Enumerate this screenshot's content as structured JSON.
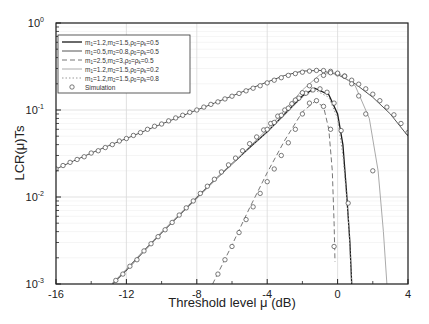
{
  "chart_data": {
    "type": "line",
    "title": "",
    "xlabel": "Threshold level μ (dB)",
    "ylabel": "LCR(μ)Ts",
    "xlim": [
      -16,
      4
    ],
    "ylim": [
      0.001,
      1
    ],
    "yscale": "log",
    "grid": true,
    "legend_position": "upper left",
    "x_ticks": [
      -16,
      -12,
      -8,
      -4,
      0,
      4
    ],
    "x_tick_labels": [
      "-16",
      "-12",
      "-8",
      "-4",
      "0",
      "4"
    ],
    "y_ticks": [
      0.001,
      0.01,
      0.1,
      1
    ],
    "y_tick_labels": [
      [
        "10",
        "-3"
      ],
      [
        "10",
        "-2"
      ],
      [
        "10",
        "-1"
      ],
      [
        "10",
        "0"
      ]
    ],
    "series": [
      {
        "name": "m1=1.2,m2=1.5,ρ0=ρk=0.5",
        "legend": [
          "m",
          "1",
          "=1.2,m",
          "2",
          "=1.5,ρ",
          "0",
          "=ρ",
          "k",
          "=0.5"
        ],
        "style": "solid",
        "color": "#1a1a1a",
        "width": 1.3,
        "x": [
          -12.8,
          -12,
          -11,
          -10,
          -9,
          -8,
          -7,
          -6,
          -5,
          -4,
          -3,
          -2,
          -1.3,
          -0.5,
          0,
          0.3,
          0.5,
          0.7,
          0.8
        ],
        "y": [
          0.001,
          0.00145,
          0.0024,
          0.0039,
          0.0062,
          0.0098,
          0.0155,
          0.024,
          0.037,
          0.056,
          0.09,
          0.145,
          0.178,
          0.15,
          0.09,
          0.04,
          0.012,
          0.003,
          0.001
        ],
        "sim_x": [
          -12.6,
          -12.2,
          -11.8,
          -11.4,
          -11,
          -10.6,
          -10.2,
          -9.8,
          -9.4,
          -9,
          -8.6,
          -8.2,
          -7.8,
          -7.4,
          -7,
          -6.6,
          -6.2,
          -5.8,
          -5.4,
          -5,
          -4.6,
          -4.2,
          -3.8,
          -3.4,
          -3,
          -2.6,
          -2.2,
          -1.8,
          -1.4,
          -1,
          -0.6,
          -0.2,
          0.2,
          0.6
        ],
        "sim_y": [
          0.0011,
          0.0013,
          0.0016,
          0.0019,
          0.0024,
          0.0029,
          0.0035,
          0.0042,
          0.0051,
          0.0062,
          0.0075,
          0.009,
          0.011,
          0.0133,
          0.016,
          0.0194,
          0.0234,
          0.028,
          0.034,
          0.041,
          0.049,
          0.059,
          0.07,
          0.085,
          0.1,
          0.118,
          0.137,
          0.156,
          0.17,
          0.175,
          0.16,
          0.12,
          0.058,
          0.0085
        ]
      },
      {
        "name": "m1=0.5,m2=0.8,ρ0=ρk=0.5",
        "legend": [
          "m",
          "1",
          "=0.5,m",
          "2",
          "=0.8,ρ",
          "0",
          "=ρ",
          "k",
          "=0.5"
        ],
        "style": "solid",
        "color": "#555555",
        "width": 1.0,
        "x": [
          -16,
          -15,
          -14,
          -13,
          -12,
          -11,
          -10,
          -9,
          -8,
          -7,
          -6,
          -5,
          -4,
          -3,
          -2,
          -1,
          0,
          1,
          2,
          3,
          4
        ],
        "y": [
          0.021,
          0.026,
          0.032,
          0.039,
          0.047,
          0.057,
          0.069,
          0.083,
          0.1,
          0.12,
          0.145,
          0.175,
          0.21,
          0.25,
          0.28,
          0.285,
          0.255,
          0.2,
          0.14,
          0.09,
          0.05
        ],
        "sim_x": [
          -16,
          -15.6,
          -15.2,
          -14.8,
          -14.4,
          -14,
          -13.6,
          -13.2,
          -12.8,
          -12.4,
          -12,
          -11.6,
          -11.2,
          -10.8,
          -10.4,
          -10,
          -9.6,
          -9.2,
          -8.8,
          -8.4,
          -8,
          -7.6,
          -7.2,
          -6.8,
          -6.4,
          -6,
          -5.6,
          -5.2,
          -4.8,
          -4.4,
          -4,
          -3.6,
          -3.2,
          -2.8,
          -2.4,
          -2,
          -1.6,
          -1.2,
          -0.8,
          -0.4,
          0,
          0.4,
          0.8,
          1.2,
          1.6,
          2,
          2.4,
          2.8,
          3.2,
          3.6,
          4
        ],
        "sim_y": [
          0.021,
          0.023,
          0.025,
          0.027,
          0.029,
          0.032,
          0.034,
          0.037,
          0.04,
          0.044,
          0.047,
          0.051,
          0.055,
          0.06,
          0.065,
          0.069,
          0.075,
          0.081,
          0.087,
          0.094,
          0.1,
          0.108,
          0.116,
          0.124,
          0.134,
          0.144,
          0.155,
          0.166,
          0.178,
          0.19,
          0.205,
          0.22,
          0.235,
          0.25,
          0.262,
          0.272,
          0.28,
          0.285,
          0.284,
          0.278,
          0.26,
          0.245,
          0.22,
          0.198,
          0.175,
          0.152,
          0.128,
          0.108,
          0.088,
          0.07,
          0.055
        ]
      },
      {
        "name": "m1=2.5,m2=3,ρ0=ρk=0.5",
        "legend": [
          "m",
          "1",
          "=2.5,m",
          "2",
          "=3,ρ",
          "0",
          "=ρ",
          "k",
          "=0.5"
        ],
        "style": "dashed",
        "color": "#777777",
        "width": 1.0,
        "x": [
          -7.1,
          -6,
          -5,
          -4,
          -3,
          -2,
          -1.3,
          -0.8,
          -0.5,
          -0.3,
          -0.2,
          -0.15
        ],
        "y": [
          0.001,
          0.0028,
          0.0075,
          0.019,
          0.045,
          0.095,
          0.125,
          0.11,
          0.06,
          0.02,
          0.005,
          0.0018
        ],
        "sim_x": [
          -6.8,
          -6.4,
          -6,
          -5.6,
          -5.2,
          -4.8,
          -4.4,
          -4,
          -3.6,
          -3.2,
          -2.8,
          -2.4,
          -2,
          -1.6,
          -1.2,
          -0.8,
          -0.4,
          -0.2
        ],
        "sim_y": [
          0.0013,
          0.0019,
          0.0027,
          0.0039,
          0.0055,
          0.0077,
          0.011,
          0.015,
          0.021,
          0.03,
          0.042,
          0.06,
          0.09,
          0.12,
          0.128,
          0.11,
          0.06,
          0.0027
        ]
      },
      {
        "name": "m1=1.2,m2=1.5,ρ0=ρk=0.2",
        "legend": [
          "m",
          "1",
          "=1.2,m",
          "2",
          "=1.5,ρ",
          "0",
          "=ρ",
          "k",
          "=0.2"
        ],
        "style": "solid",
        "color": "#aaaaaa",
        "width": 1.0,
        "x": [
          -12.8,
          -12,
          -11,
          -10,
          -9,
          -8,
          -7,
          -6,
          -5,
          -4,
          -3,
          -2,
          -1,
          0,
          1,
          1.8,
          2.3,
          2.6,
          2.8
        ],
        "y": [
          0.001,
          0.00145,
          0.0024,
          0.0039,
          0.0062,
          0.0098,
          0.0155,
          0.024,
          0.038,
          0.06,
          0.1,
          0.17,
          0.255,
          0.27,
          0.19,
          0.08,
          0.02,
          0.004,
          0.001
        ],
        "sim_x": [
          -4,
          -3.6,
          -3.2,
          -2.8,
          -2.4,
          -2,
          -1.6,
          -1.2,
          -0.8,
          -0.4,
          0,
          0.4,
          0.8,
          1.2,
          1.6,
          2
        ],
        "sim_y": [
          0.06,
          0.072,
          0.087,
          0.105,
          0.13,
          0.158,
          0.19,
          0.22,
          0.25,
          0.268,
          0.265,
          0.245,
          0.2,
          0.145,
          0.09,
          0.02
        ]
      },
      {
        "name": "m1=1.2,m2=1.5,ρ0=ρk=0.8",
        "legend": [
          "m",
          "1",
          "=1.2,m",
          "2",
          "=1.5,ρ",
          "0",
          "=ρ",
          "k",
          "=0.8"
        ],
        "style": "dotted",
        "color": "#999999",
        "width": 1.0,
        "x": [
          -12.8,
          -12,
          -11,
          -10,
          -9,
          -8,
          -7,
          -6,
          -5,
          -4,
          -3,
          -2,
          -1.3,
          -0.5,
          0,
          0.3,
          0.6,
          0.8
        ],
        "y": [
          0.001,
          0.00145,
          0.0024,
          0.0039,
          0.0062,
          0.0098,
          0.0155,
          0.024,
          0.037,
          0.056,
          0.09,
          0.14,
          0.17,
          0.14,
          0.08,
          0.03,
          0.006,
          0.001
        ],
        "sim_x": [],
        "sim_y": []
      }
    ],
    "legend_simulation": "Simulation",
    "colors": {
      "axis": "#222222",
      "grid": "#d9d9d9",
      "minor_grid": "#eeeeee",
      "background": "#ffffff"
    }
  }
}
